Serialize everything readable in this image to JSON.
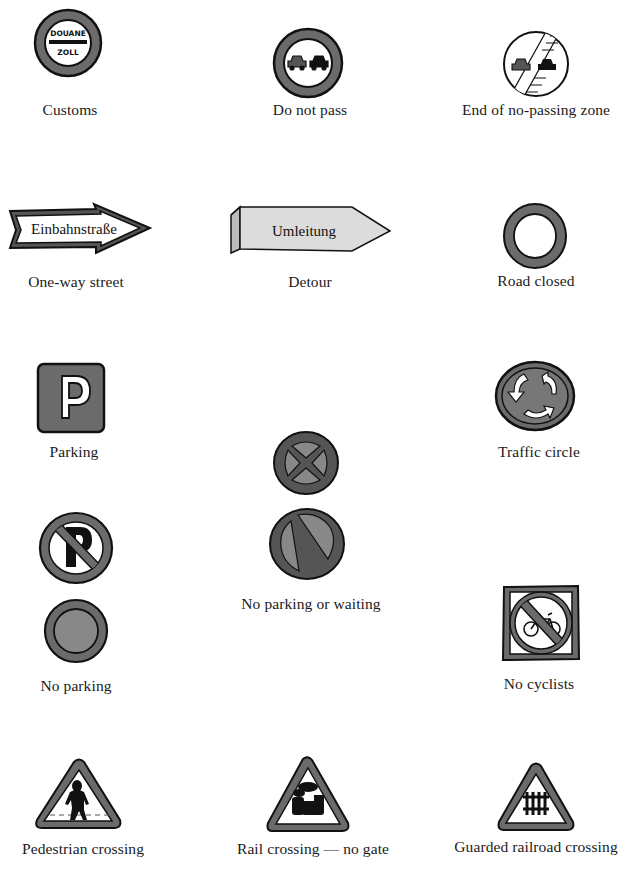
{
  "colors": {
    "ink": "#111111",
    "sign_gray": "#6b6b6b",
    "sign_gray_light": "#8a8a8a",
    "detour_fill": "#dcdcdc",
    "background": "#ffffff"
  },
  "signs": [
    {
      "id": "customs",
      "label": "Customs",
      "text_top": "DOUANE",
      "text_bottom": "ZOLL"
    },
    {
      "id": "do-not-pass",
      "label": "Do not pass"
    },
    {
      "id": "end-no-passing",
      "label": "End of no-passing zone"
    },
    {
      "id": "one-way-street",
      "label": "One-way street",
      "sign_text": "Einbahnstraße"
    },
    {
      "id": "detour",
      "label": "Detour",
      "sign_text": "Umleitung"
    },
    {
      "id": "road-closed",
      "label": "Road closed"
    },
    {
      "id": "parking",
      "label": "Parking",
      "sign_text": "P"
    },
    {
      "id": "traffic-circle",
      "label": "Traffic circle"
    },
    {
      "id": "no-parking-or-waiting",
      "label": "No parking or waiting"
    },
    {
      "id": "no-parking",
      "label": "No parking",
      "sign_text": "P"
    },
    {
      "id": "no-cyclists",
      "label": "No cyclists"
    },
    {
      "id": "pedestrian-crossing",
      "label": "Pedestrian crossing"
    },
    {
      "id": "rail-crossing-no-gate",
      "label": "Rail crossing — no gate"
    },
    {
      "id": "guarded-railroad-crossing",
      "label": "Guarded railroad crossing"
    }
  ]
}
